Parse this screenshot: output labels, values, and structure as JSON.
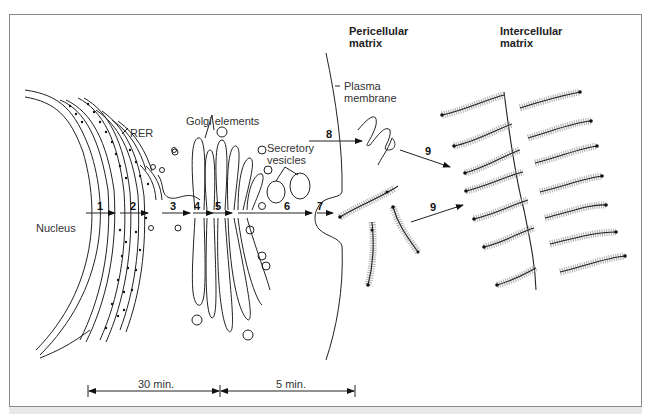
{
  "diagram": {
    "labels": {
      "nucleus": "Nucleus",
      "rer": "RER",
      "golgi": "Golgi elements",
      "secretory_line1": "Secretory",
      "secretory_line2": "vesicles",
      "plasma_line1": "Plasma",
      "plasma_line2": "membrane",
      "pericellular_line1": "Pericellular",
      "pericellular_line2": "matrix",
      "intercellular_line1": "Intercellular",
      "intercellular_line2": "matrix"
    },
    "steps": [
      "1",
      "2",
      "3",
      "4",
      "5",
      "6",
      "7",
      "8",
      "9",
      "9"
    ],
    "timeline": {
      "segment1": "30 min.",
      "segment2": "5 min."
    }
  }
}
